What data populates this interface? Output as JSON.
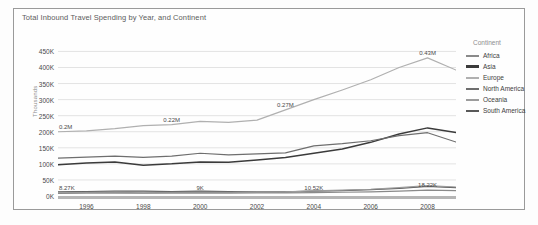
{
  "chart": {
    "title": "Total Inbound Travel Spending by Year, and Continent",
    "y_axis_title": "Thousands"
  },
  "legend": {
    "title": "Continent",
    "items": [
      {
        "label": "Africa",
        "color": "#8a8a8a"
      },
      {
        "label": "Asia",
        "color": "#3b3b3b"
      },
      {
        "label": "Europe",
        "color": "#b0b0b0"
      },
      {
        "label": "North America",
        "color": "#6e6e6e"
      },
      {
        "label": "Oceania",
        "color": "#9c9c9c"
      },
      {
        "label": "South America",
        "color": "#595959"
      }
    ]
  },
  "chart_data": {
    "type": "line",
    "title": "Total Inbound Travel Spending by Year, and Continent",
    "xlabel": "",
    "ylabel": "Thousands",
    "ylim": [
      0,
      470
    ],
    "xlim": [
      1995,
      2009
    ],
    "grid": true,
    "legend_position": "right",
    "y_ticks": [
      "0K",
      "50K",
      "100K",
      "150K",
      "200K",
      "250K",
      "300K",
      "350K",
      "400K",
      "450K"
    ],
    "y_tick_values": [
      0,
      50,
      100,
      150,
      200,
      250,
      300,
      350,
      400,
      450
    ],
    "x_ticks": [
      "1996",
      "1998",
      "2000",
      "2002",
      "2004",
      "2006",
      "2008"
    ],
    "x_tick_values": [
      1996,
      1998,
      2000,
      2002,
      2004,
      2006,
      2008
    ],
    "x": [
      1995,
      1996,
      1997,
      1998,
      1999,
      2000,
      2001,
      2002,
      2003,
      2004,
      2005,
      2006,
      2007,
      2008,
      2009
    ],
    "series": [
      {
        "name": "Europe",
        "color": "#b0b0b0",
        "values": [
          200,
          203,
          210,
          219,
          222,
          232,
          229,
          236,
          268,
          300,
          330,
          362,
          400,
          430,
          392
        ]
      },
      {
        "name": "Asia",
        "color": "#3b3b3b",
        "values": [
          97,
          103,
          106,
          96,
          100,
          106,
          105,
          112,
          120,
          133,
          146,
          167,
          193,
          212,
          198
        ]
      },
      {
        "name": "North America",
        "color": "#6e6e6e",
        "values": [
          118,
          121,
          124,
          120,
          124,
          133,
          128,
          131,
          134,
          156,
          163,
          172,
          188,
          197,
          168
        ]
      },
      {
        "name": "South America",
        "color": "#595959",
        "values": [
          13,
          14,
          15,
          15,
          14,
          15,
          14,
          13,
          13,
          15,
          17,
          20,
          24,
          30,
          26
        ]
      },
      {
        "name": "Oceania",
        "color": "#9c9c9c",
        "values": [
          10,
          11,
          11,
          10,
          11,
          12,
          11,
          12,
          13,
          16,
          18,
          21,
          26,
          32,
          28
        ]
      },
      {
        "name": "Africa",
        "color": "#8a8a8a",
        "values": [
          8.27,
          8.6,
          8.8,
          8.7,
          8.9,
          9.0,
          9.1,
          9.4,
          9.8,
          10.52,
          11.6,
          13.0,
          15.4,
          18.22,
          17.0
        ]
      }
    ],
    "annotations": [
      {
        "text": "0.2M",
        "x": 1995,
        "y": 200
      },
      {
        "text": "0.22M",
        "x": 1999,
        "y": 222
      },
      {
        "text": "0.27M",
        "x": 2003,
        "y": 268
      },
      {
        "text": "0.43M",
        "x": 2008,
        "y": 430
      },
      {
        "text": "8.27K",
        "x": 1995,
        "y": 8.27
      },
      {
        "text": "9K",
        "x": 2000,
        "y": 9.0
      },
      {
        "text": "10.52K",
        "x": 2004,
        "y": 10.52
      },
      {
        "text": "18.22K",
        "x": 2008,
        "y": 18.22
      }
    ]
  }
}
